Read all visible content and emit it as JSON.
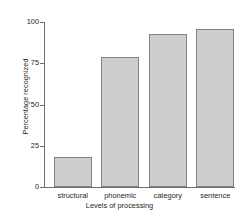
{
  "chart_data": {
    "type": "bar",
    "title": "",
    "xlabel": "Levels of processing",
    "ylabel": "Percentage recognized",
    "categories": [
      "structural",
      "phonemic",
      "category",
      "sentence"
    ],
    "values": [
      18,
      79,
      93,
      96
    ],
    "ylim": [
      0,
      100
    ],
    "yticks": [
      0,
      25,
      50,
      75,
      100
    ],
    "ytick_labels": [
      "0",
      "25",
      "50",
      "75",
      "100"
    ],
    "grid": false,
    "legend": null,
    "bar_color": "#cdcdcd",
    "bar_edge_color": "#808285",
    "axis_color": "#6d6e71",
    "background": "#ffffff"
  }
}
